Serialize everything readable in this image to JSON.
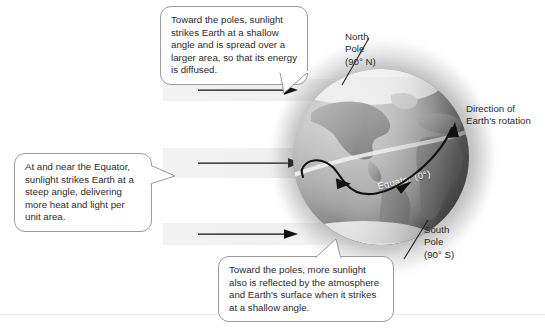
{
  "diagram": {
    "callouts": [
      {
        "id": "poles-shallow-angle",
        "text": "Toward the poles, sunlight strikes Earth at a shallow angle and is spread over a larger area, so that its energy is diffused."
      },
      {
        "id": "equator-steep-angle",
        "text": "At and near the Equator, sunlight strikes Earth at a steep angle, delivering more heat and light per unit area."
      },
      {
        "id": "poles-reflection",
        "text": "Toward the poles, more sunlight also is reflected by the atmosphere and Earth's surface when it strikes at a shallow angle."
      }
    ],
    "labels": {
      "north_pole": "North\nPole\n(90° N)",
      "south_pole": "South\nPole\n(90° S)",
      "rotation": "Direction of\nEarth's rotation",
      "equator": "Equator (0°)"
    },
    "beams": [
      {
        "id": "beam-top",
        "label": "sunlight-beam-polar-north"
      },
      {
        "id": "beam-middle",
        "label": "sunlight-beam-equator"
      },
      {
        "id": "beam-bottom",
        "label": "sunlight-beam-polar-south"
      }
    ],
    "colors": {
      "balloon_border": "#9a9a9a",
      "balloon_fill": "#ffffff",
      "text": "#2b2b2b",
      "beam": "#f1f1f1",
      "arrow": "#111111",
      "equator_text": "#ffffff",
      "ocean_light": "#c2c2c2",
      "ocean_dark": "#6f6f6f",
      "land": "#8f8f8f",
      "ice": "#f4f4f4"
    }
  }
}
